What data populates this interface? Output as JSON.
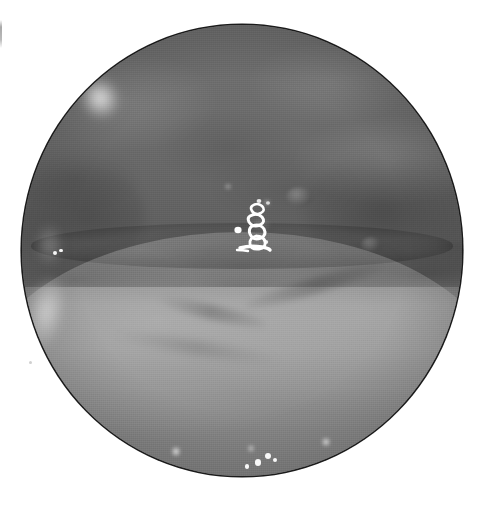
{
  "image": {
    "kind": "endoscopic-photograph",
    "modality": "white-light endoscopy",
    "color_mode": "grayscale",
    "width_px": 479,
    "height_px": 507,
    "background_color": "#ffffff",
    "field_of_view": {
      "shape": "circle",
      "center_x_px": 242,
      "center_y_px": 250,
      "diameter_x_px": 440,
      "diameter_y_px": 451,
      "border_color": "#1b1b1b",
      "border_width_px": 2
    },
    "tones": {
      "darkest_gray": "#4e4e4e",
      "upper_mucosa_gray": "#6b6b6b",
      "cleft_shadow_gray": "#565656",
      "lower_tissue_gray": "#8c8c8c",
      "highlight_white": "#ffffff"
    },
    "features": [
      {
        "name": "upper-mucosal-wall",
        "description": "Darker mottled mucosal surface occupying the upper half of the field",
        "region": "top",
        "mean_gray": "#6b6b6b"
      },
      {
        "name": "horizontal-cleft-fold",
        "description": "Dark curved crease running left to right across the mid-field",
        "region": "middle",
        "approx_y_px": 245,
        "mean_gray": "#565656"
      },
      {
        "name": "lower-tissue-mound",
        "description": "Lighter rounded tissue mound filling the lower half",
        "region": "bottom",
        "mean_gray": "#8c8c8c"
      },
      {
        "name": "v-shaped-groove",
        "description": "Shallow V-shaped groove converging toward lower mid-field",
        "region": "lower-center",
        "approx_apex_px": [
          250,
          382
        ]
      },
      {
        "name": "specular-highlight-cluster",
        "description": "Bright irregular specular reflection of the endoscope light near the center",
        "region": "center",
        "approx_center_px": [
          257,
          228
        ]
      },
      {
        "name": "rim-glare-upper-left",
        "description": "Diffuse bright glare along the upper-left aperture rim",
        "approx_center_px": [
          100,
          94
        ]
      },
      {
        "name": "rim-glare-lower-left",
        "description": "Soft light band along the lower-left aperture rim",
        "approx_center_px": [
          40,
          300
        ]
      },
      {
        "name": "specular-dots-bottom",
        "description": "Small bright specular dots near the lower edge of the field",
        "count": 6
      },
      {
        "name": "mucosal-papillae",
        "description": "Small rounded bumps on the right mid-field mucosa",
        "count": 3
      },
      {
        "name": "vignette",
        "description": "Progressive darkening toward the circular aperture edge"
      }
    ],
    "artifacts": [
      {
        "name": "edge-scan-line",
        "description": "Faint vertical gray line on the left white margin",
        "approx_px": [
          0,
          20,
          2,
          28
        ]
      },
      {
        "name": "dust-speck",
        "description": "Tiny faint gray speck on the left white margin",
        "approx_px": [
          29,
          361
        ]
      }
    ],
    "specular_dots": [
      {
        "x": 55,
        "y": 252,
        "r": 2.0,
        "soft": false
      },
      {
        "x": 61,
        "y": 250,
        "r": 1.6,
        "soft": false
      },
      {
        "x": 258,
        "y": 462,
        "r": 3.4,
        "soft": false
      },
      {
        "x": 268,
        "y": 455,
        "r": 3.0,
        "soft": false
      },
      {
        "x": 247,
        "y": 466,
        "r": 2.2,
        "soft": false
      },
      {
        "x": 275,
        "y": 459,
        "r": 2.0,
        "soft": false
      },
      {
        "x": 326,
        "y": 441,
        "r": 3.0,
        "soft": true
      },
      {
        "x": 176,
        "y": 451,
        "r": 3.2,
        "soft": true
      },
      {
        "x": 251,
        "y": 448,
        "r": 2.4,
        "soft": true
      },
      {
        "x": 228,
        "y": 186,
        "r": 1.8,
        "soft": true
      },
      {
        "x": 267,
        "y": 202,
        "r": 1.6,
        "soft": true
      }
    ],
    "alt_text": "Grayscale endoscopic photograph showing a circular field of view of a mucosal surface with an upper darker wall, a horizontal fold, a lighter tissue mound below, and a bright specular light reflection at the centre."
  }
}
